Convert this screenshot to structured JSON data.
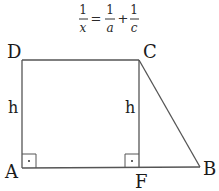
{
  "formula": {
    "lhs": {
      "numerator": "1",
      "denominator": "x"
    },
    "equals": "=",
    "term1": {
      "numerator": "1",
      "denominator": "a"
    },
    "plus": "+",
    "term2": {
      "numerator": "1",
      "denominator": "c"
    }
  },
  "vertices": {
    "A": "A",
    "B": "B",
    "C": "C",
    "D": "D",
    "F": "F"
  },
  "heights": {
    "left": "h",
    "right": "h"
  },
  "colors": {
    "line": "#555555",
    "text": "#1a1a1a"
  }
}
